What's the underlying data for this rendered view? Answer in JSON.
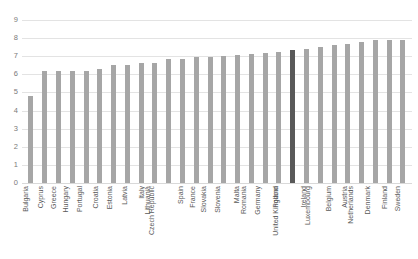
{
  "chart_data": {
    "type": "bar",
    "title": "",
    "subtitle": "",
    "xlabel": "",
    "ylabel": "",
    "ylim": [
      0,
      9
    ],
    "yticks": [
      0,
      1,
      2,
      3,
      4,
      5,
      6,
      7,
      8,
      9
    ],
    "ytick_labels": [
      "0",
      "1",
      "2",
      "3",
      "4",
      "5",
      "6",
      "7",
      "8",
      "9"
    ],
    "grid": true,
    "legend": "none",
    "orientation": "vertical",
    "highlight_category": "United Kingdom",
    "colors": {
      "bar": "#a6a6a6",
      "bar_highlight": "#595959",
      "gridline": "#e3e3e3",
      "tick_label": "#7a7a7a",
      "category_label": "#595959",
      "background": "#ffffff"
    },
    "categories": [
      "Bulgaria",
      "Cyprus",
      "Greece",
      "Hungary",
      "Portugal",
      "Croatia",
      "Estonia",
      "Latvia",
      "Italy",
      "Lithuania",
      "Czech Republic",
      "Spain",
      "France",
      "Slovakia",
      "Slovenia",
      "Malta",
      "Romania",
      "Germany",
      "Poland",
      "United Kingdom",
      "Ireland",
      "Luxembourg",
      "Belgium",
      "Austria",
      "Netherlands",
      "Denmark",
      "Finland",
      "Sweden"
    ],
    "values": [
      4.8,
      6.2,
      6.2,
      6.2,
      6.2,
      6.3,
      6.5,
      6.5,
      6.65,
      6.65,
      6.85,
      6.85,
      6.95,
      6.95,
      7.0,
      7.05,
      7.1,
      7.2,
      7.25,
      7.35,
      7.4,
      7.5,
      7.6,
      7.7,
      7.8,
      7.9,
      7.9,
      7.9
    ]
  }
}
